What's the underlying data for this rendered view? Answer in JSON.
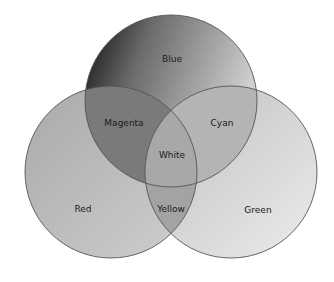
{
  "diagram": {
    "type": "venn",
    "circles": [
      {
        "id": "blue",
        "label": "Blue",
        "cx": 171,
        "cy": 101,
        "r": 86
      },
      {
        "id": "red",
        "label": "Red",
        "cx": 111,
        "cy": 172,
        "r": 86
      },
      {
        "id": "green",
        "label": "Green",
        "cx": 231,
        "cy": 172,
        "r": 86
      }
    ],
    "regions": {
      "blue": "Blue",
      "red": "Red",
      "green": "Green",
      "magenta": "Magenta",
      "cyan": "Cyan",
      "yellow": "Yellow",
      "white": "White"
    },
    "colors": {
      "stroke": "#555555",
      "background": "#ffffff"
    }
  }
}
